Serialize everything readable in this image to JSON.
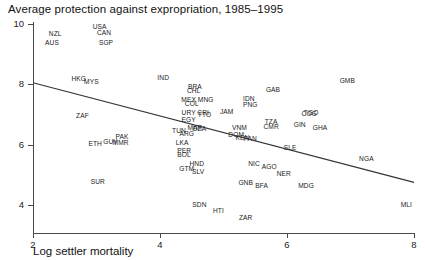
{
  "chart_data": {
    "type": "scatter",
    "title": "Average protection against expropriation, 1985–1995",
    "xlabel": "Log settler mortality",
    "ylabel": "",
    "xlim": [
      2,
      8
    ],
    "ylim": [
      3.2,
      10
    ],
    "xticks": [
      "2",
      "4",
      "6",
      "8"
    ],
    "xtick_values": [
      2,
      4,
      6,
      8
    ],
    "yticks": [
      "10",
      "8",
      "6",
      "4"
    ],
    "ytick_values": [
      10,
      8,
      6,
      4
    ],
    "grid": false,
    "legend": "none",
    "point_style": "text-labels",
    "fit_line": {
      "type": "linear-regression",
      "x_start": 2.0,
      "y_start": 8.05,
      "x_end": 8.0,
      "y_end": 4.75
    },
    "labels": [
      "NZL",
      "USA",
      "CAN",
      "AUS",
      "SGP",
      "HKG",
      "MYS",
      "IND",
      "BRA",
      "CHL",
      "MEX",
      "MNG",
      "COL",
      "ZAF",
      "URY",
      "CRI",
      "TTO",
      "EGY",
      "IDN",
      "PNG",
      "GAB",
      "GMB",
      "JAM",
      "TUN",
      "ARG",
      "MAR",
      "DZA",
      "VNM",
      "DOM",
      "KEN",
      "PAN",
      "TZA",
      "CMR",
      "GIN",
      "GHA",
      "TGO",
      "COG",
      "PAK",
      "GUY",
      "MMR",
      "ETH",
      "LKA",
      "PER",
      "BOL",
      "SLE",
      "NGA",
      "HND",
      "SLV",
      "GTM",
      "NIC",
      "AGO",
      "NER",
      "SUR",
      "GNB",
      "COG",
      "BFA",
      "MDG",
      "SDN",
      "HTI",
      "ZAR",
      "MLI"
    ],
    "points": [
      {
        "label": "NZL",
        "x": 2.35,
        "y": 9.7
      },
      {
        "label": "USA",
        "x": 3.05,
        "y": 9.95
      },
      {
        "label": "CAN",
        "x": 3.12,
        "y": 9.72
      },
      {
        "label": "AUS",
        "x": 2.3,
        "y": 9.4
      },
      {
        "label": "SGP",
        "x": 3.15,
        "y": 9.42
      },
      {
        "label": "HKG",
        "x": 2.72,
        "y": 8.22
      },
      {
        "label": "MYS",
        "x": 2.92,
        "y": 8.1
      },
      {
        "label": "IND",
        "x": 4.05,
        "y": 8.25
      },
      {
        "label": "BRA",
        "x": 4.55,
        "y": 7.95
      },
      {
        "label": "CHL",
        "x": 4.53,
        "y": 7.83
      },
      {
        "label": "MEX",
        "x": 4.45,
        "y": 7.52
      },
      {
        "label": "MNG",
        "x": 4.72,
        "y": 7.52
      },
      {
        "label": "COL",
        "x": 4.5,
        "y": 7.38
      },
      {
        "label": "ZAF",
        "x": 2.78,
        "y": 7.0
      },
      {
        "label": "URY",
        "x": 4.45,
        "y": 7.1
      },
      {
        "label": "CRI",
        "x": 4.68,
        "y": 7.08
      },
      {
        "label": "TTO",
        "x": 4.7,
        "y": 7.02
      },
      {
        "label": "EGY",
        "x": 4.45,
        "y": 6.85
      },
      {
        "label": "IDN",
        "x": 5.4,
        "y": 7.55
      },
      {
        "label": "PNG",
        "x": 5.42,
        "y": 7.35
      },
      {
        "label": "GAB",
        "x": 5.78,
        "y": 7.85
      },
      {
        "label": "GMB",
        "x": 6.95,
        "y": 8.15
      },
      {
        "label": "JAM",
        "x": 5.05,
        "y": 7.12
      },
      {
        "label": "TUN",
        "x": 4.3,
        "y": 6.48
      },
      {
        "label": "ARG",
        "x": 4.42,
        "y": 6.4
      },
      {
        "label": "MAR",
        "x": 4.55,
        "y": 6.58
      },
      {
        "label": "DZA",
        "x": 4.62,
        "y": 6.55
      },
      {
        "label": "VNM",
        "x": 5.25,
        "y": 6.6
      },
      {
        "label": "DOM",
        "x": 5.2,
        "y": 6.35
      },
      {
        "label": "KEN",
        "x": 5.3,
        "y": 6.25
      },
      {
        "label": "PAN",
        "x": 5.42,
        "y": 6.22
      },
      {
        "label": "TZA",
        "x": 5.75,
        "y": 6.78
      },
      {
        "label": "CMR",
        "x": 5.75,
        "y": 6.62
      },
      {
        "label": "GIN",
        "x": 6.2,
        "y": 6.7
      },
      {
        "label": "GHA",
        "x": 6.52,
        "y": 6.58
      },
      {
        "label": "TGO",
        "x": 6.38,
        "y": 7.1
      },
      {
        "label": "COG",
        "x": 6.35,
        "y": 7.05
      },
      {
        "label": "PAK",
        "x": 3.4,
        "y": 6.3
      },
      {
        "label": "GUY",
        "x": 3.22,
        "y": 6.12
      },
      {
        "label": "MMR",
        "x": 3.38,
        "y": 6.1
      },
      {
        "label": "ETH",
        "x": 2.98,
        "y": 6.05
      },
      {
        "label": "LKA",
        "x": 4.35,
        "y": 6.1
      },
      {
        "label": "PER",
        "x": 4.38,
        "y": 5.82
      },
      {
        "label": "BOL",
        "x": 4.38,
        "y": 5.68
      },
      {
        "label": "SLE",
        "x": 6.05,
        "y": 5.92
      },
      {
        "label": "NGA",
        "x": 7.25,
        "y": 5.55
      },
      {
        "label": "HND",
        "x": 4.58,
        "y": 5.38
      },
      {
        "label": "SLV",
        "x": 4.6,
        "y": 5.12
      },
      {
        "label": "GTM",
        "x": 4.42,
        "y": 5.22
      },
      {
        "label": "NIC",
        "x": 5.48,
        "y": 5.38
      },
      {
        "label": "AGO",
        "x": 5.72,
        "y": 5.28
      },
      {
        "label": "NER",
        "x": 5.95,
        "y": 5.05
      },
      {
        "label": "SUR",
        "x": 3.02,
        "y": 4.8
      },
      {
        "label": "GNB",
        "x": 5.35,
        "y": 4.75
      },
      {
        "label": "BFA",
        "x": 5.6,
        "y": 4.65
      },
      {
        "label": "MDG",
        "x": 6.3,
        "y": 4.68
      },
      {
        "label": "SDN",
        "x": 4.62,
        "y": 4.05
      },
      {
        "label": "HTI",
        "x": 4.92,
        "y": 3.82
      },
      {
        "label": "ZAR",
        "x": 5.35,
        "y": 3.62
      },
      {
        "label": "MLI",
        "x": 7.88,
        "y": 4.02
      }
    ]
  }
}
